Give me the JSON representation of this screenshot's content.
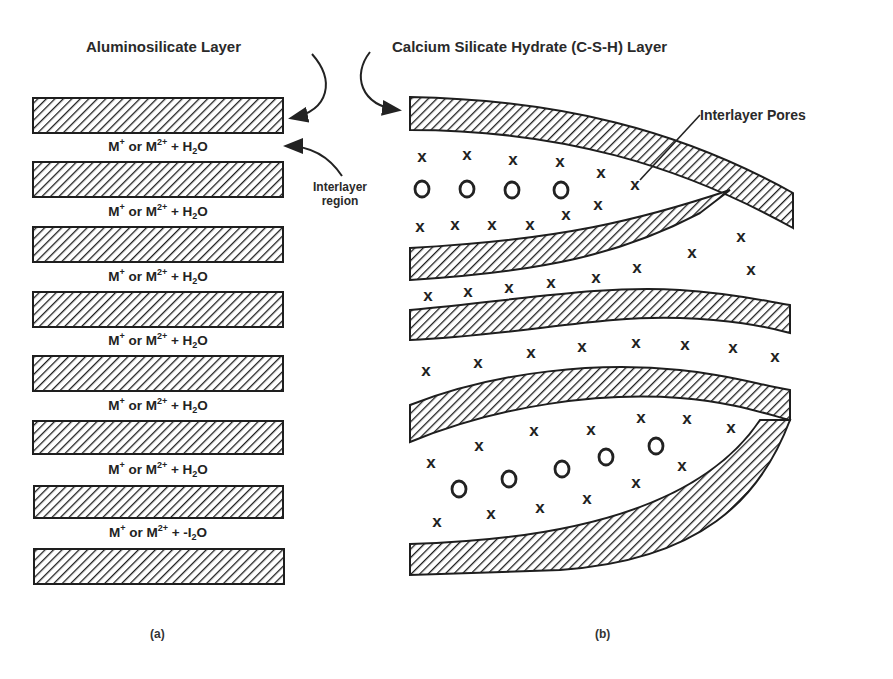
{
  "diagram": {
    "panel_a": {
      "title": "Aluminosilicate Layer",
      "interlayer_label_line1": "Interlayer",
      "interlayer_label_line2": "region",
      "caption": "(a)",
      "layer_count": 8,
      "interlayer_count": 7,
      "interlayers": [
        {
          "cation": "M",
          "sup1": "+",
          "or": " or ",
          "cation2": "M",
          "sup2": "2+",
          "plus": " + ",
          "water": "H",
          "sub": "2",
          "water_end": "O"
        },
        {
          "cation": "M",
          "sup1": "+",
          "or": " or ",
          "cation2": "M",
          "sup2": "2+",
          "plus": " + ",
          "water": "H",
          "sub": "2",
          "water_end": "O"
        },
        {
          "cation": "M",
          "sup1": "+",
          "or": " or ",
          "cation2": "M",
          "sup2": "2+",
          "plus": " + ",
          "water": "H",
          "sub": "2",
          "water_end": "O"
        },
        {
          "cation": "M",
          "sup1": "+",
          "or": " or ",
          "cation2": "M",
          "sup2": "2+",
          "plus": " + ",
          "water": "H",
          "sub": "2",
          "water_end": "O"
        },
        {
          "cation": "M",
          "sup1": "+",
          "or": " or ",
          "cation2": "M",
          "sup2": "2+",
          "plus": " + ",
          "water": "H",
          "sub": "2",
          "water_end": "O"
        },
        {
          "cation": "M",
          "sup1": "+",
          "or": " or ",
          "cation2": "M",
          "sup2": "2+",
          "plus": " + ",
          "water": "H",
          "sub": "2",
          "water_end": "O"
        },
        {
          "cation": "M",
          "sup1": "+",
          "or": " or ",
          "cation2": "M",
          "sup2": "2+",
          "plus": " + ",
          "water": "-I",
          "sub": "2",
          "water_end": "O"
        }
      ]
    },
    "panel_b": {
      "title": "Calcium Silicate Hydrate (C-S-H) Layer",
      "pores_label": "Interlayer Pores",
      "caption": "(b)",
      "legend_symbols": {
        "x": "x",
        "o": "o"
      }
    },
    "colors": {
      "ink": "#222222",
      "background": "#ffffff"
    }
  }
}
